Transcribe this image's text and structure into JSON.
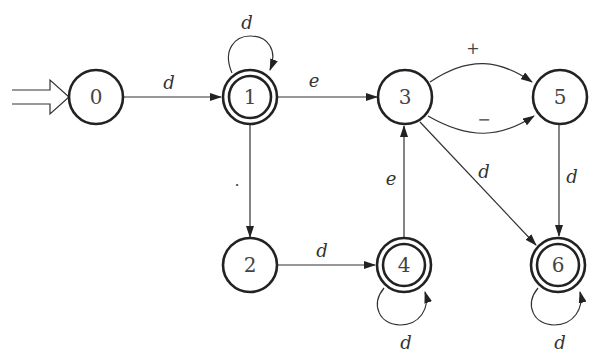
{
  "diagram": {
    "type": "finite-automaton",
    "start_state": "0",
    "states": [
      {
        "id": "0",
        "label": "0",
        "accepting": false
      },
      {
        "id": "1",
        "label": "1",
        "accepting": true
      },
      {
        "id": "2",
        "label": "2",
        "accepting": false
      },
      {
        "id": "3",
        "label": "3",
        "accepting": false
      },
      {
        "id": "4",
        "label": "4",
        "accepting": true
      },
      {
        "id": "5",
        "label": "5",
        "accepting": false
      },
      {
        "id": "6",
        "label": "6",
        "accepting": true
      }
    ],
    "transitions": [
      {
        "from": "0",
        "to": "1",
        "label": "d"
      },
      {
        "from": "1",
        "to": "1",
        "label": "d"
      },
      {
        "from": "1",
        "to": "3",
        "label": "e"
      },
      {
        "from": "1",
        "to": "2",
        "label": "."
      },
      {
        "from": "2",
        "to": "4",
        "label": "d"
      },
      {
        "from": "4",
        "to": "4",
        "label": "d"
      },
      {
        "from": "4",
        "to": "3",
        "label": "e"
      },
      {
        "from": "3",
        "to": "5",
        "label": "+"
      },
      {
        "from": "3",
        "to": "5",
        "label": "−"
      },
      {
        "from": "3",
        "to": "6",
        "label": "d"
      },
      {
        "from": "5",
        "to": "6",
        "label": "d"
      },
      {
        "from": "6",
        "to": "6",
        "label": "d"
      }
    ]
  }
}
